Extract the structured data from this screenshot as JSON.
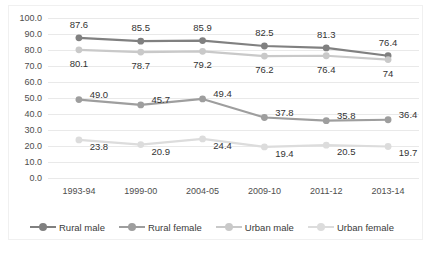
{
  "chart_data": {
    "type": "line",
    "title": "",
    "xlabel": "",
    "ylabel": "",
    "ylim": [
      0,
      100
    ],
    "ytick_step": 10,
    "grid": true,
    "legend_position": "bottom",
    "categories": [
      "1993-94",
      "1999-00",
      "2004-05",
      "2009-10",
      "2011-12",
      "2013-14"
    ],
    "ytick_labels": [
      "100.0",
      "90.0",
      "80.0",
      "70.0",
      "60.0",
      "50.0",
      "40.0",
      "30.0",
      "20.0",
      "10.0",
      "0.0"
    ],
    "ytick_values": [
      100,
      90,
      80,
      70,
      60,
      50,
      40,
      30,
      20,
      10,
      0
    ],
    "series": [
      {
        "name": "Rural male",
        "color": "#808080",
        "label_position": "above",
        "values": [
          87.6,
          85.5,
          85.9,
          82.5,
          81.3,
          76.4
        ],
        "labels": [
          "87.6",
          "85.5",
          "85.9",
          "82.5",
          "81.3",
          "76.4"
        ]
      },
      {
        "name": "Rural female",
        "color": "#9e9e9e",
        "label_position": "right",
        "values": [
          49.0,
          45.7,
          49.4,
          37.8,
          35.8,
          36.4
        ],
        "labels": [
          "49.0",
          "45.7",
          "49.4",
          "37.8",
          "35.8",
          "36.4"
        ]
      },
      {
        "name": "Urban male",
        "color": "#c9c9c9",
        "label_position": "below",
        "values": [
          80.1,
          78.7,
          79.2,
          76.2,
          76.4,
          74.0
        ],
        "labels": [
          "80.1",
          "78.7",
          "79.2",
          "76.2",
          "76.4",
          "74"
        ]
      },
      {
        "name": "Urban female",
        "color": "#dcdcdc",
        "label_position": "right-below",
        "values": [
          23.8,
          20.9,
          24.4,
          19.4,
          20.5,
          19.7
        ],
        "labels": [
          "23.8",
          "20.9",
          "24.4",
          "19.4",
          "20.5",
          "19.7"
        ]
      }
    ]
  }
}
